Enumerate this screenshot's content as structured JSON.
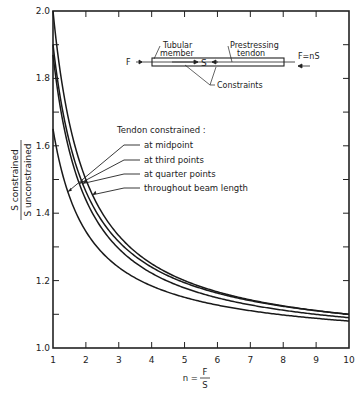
{
  "chart_data": {
    "type": "line",
    "title": "",
    "xlabel": "n = F/S",
    "xlabel_num": "F",
    "xlabel_den": "S",
    "ylabel_num": "S constrained",
    "ylabel_den": "S unconstrained",
    "xlim": [
      1,
      10
    ],
    "ylim": [
      1.0,
      2.0
    ],
    "x_ticks": [
      "1",
      "2",
      "3",
      "4",
      "5",
      "6",
      "7",
      "8",
      "9",
      "10"
    ],
    "y_ticks": [
      "1.0",
      "1.2",
      "1.4",
      "1.6",
      "1.8",
      "2.0"
    ],
    "grid": false,
    "legend_title": "Tendon constrained :",
    "x": [
      1,
      1.5,
      2,
      2.5,
      3,
      4,
      5,
      6,
      7,
      8,
      9,
      10
    ],
    "series": [
      {
        "name": "at midpoint",
        "values": [
          1.65,
          1.48,
          1.39,
          1.33,
          1.28,
          1.22,
          1.18,
          1.15,
          1.13,
          1.11,
          1.1,
          1.08
        ]
      },
      {
        "name": "at third points",
        "values": [
          1.87,
          1.61,
          1.48,
          1.4,
          1.34,
          1.26,
          1.21,
          1.17,
          1.15,
          1.13,
          1.11,
          1.09
        ]
      },
      {
        "name": "at quarter points",
        "values": [
          1.9,
          1.63,
          1.5,
          1.41,
          1.35,
          1.27,
          1.21,
          1.18,
          1.15,
          1.13,
          1.12,
          1.1
        ]
      },
      {
        "name": "throughout beam length",
        "values": [
          2.0,
          1.67,
          1.52,
          1.43,
          1.37,
          1.28,
          1.22,
          1.19,
          1.16,
          1.14,
          1.12,
          1.1
        ]
      }
    ],
    "inset": {
      "labels": {
        "tubular": "Tubular member",
        "tendon": "Prestressing tendon",
        "constraints": "Constraints",
        "F_left": "F",
        "S": "S",
        "F_right": "F=nS"
      }
    }
  }
}
